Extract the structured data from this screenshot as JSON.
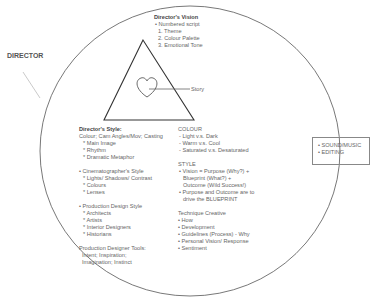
{
  "title": "DIRECTOR",
  "vision": {
    "heading": "Director's Vision",
    "items": [
      "• Numbered script",
      "1. Theme",
      "2. Colour Palette",
      "3. Emotional Tone"
    ]
  },
  "story_label": "Story",
  "style": {
    "heading": "Director's Style:",
    "lines": [
      "Colour; Cam Angles/Mov; Casting",
      "* Main Image",
      "* Rhythm",
      "* Dramatic Metaphor"
    ]
  },
  "cinematographer": {
    "lines": [
      "• Cinematographer's Style",
      "* Lights/ Shadows/ Contrast",
      "* Colours",
      "* Lenses"
    ]
  },
  "production_design": {
    "lines": [
      "• Production Design Style",
      "* Architects",
      "* Artists",
      "* Interior Designers",
      "* Historians"
    ]
  },
  "designer_tools": {
    "lines": [
      "Production Designer Tools:",
      "Intent; Inspiration;",
      "Imagination; Instinct"
    ]
  },
  "colour": {
    "heading": "COLOUR",
    "lines": [
      "- Light v.s. Dark",
      "- Warm v.s. Cool",
      "- Saturated v.s. Desaturated"
    ]
  },
  "style2": {
    "heading": "STYLE",
    "lines": [
      "• Vision = Purpose (Why?) +",
      "Blueprint (What?) +",
      "Outcome (Wild Success!)",
      "• Purpose and Outcome are to",
      "drive the BLUEPRINT"
    ]
  },
  "technique": {
    "heading": "Technique Creative",
    "lines": [
      "• How",
      "• Development",
      "• Guidelines (Process) - Why",
      "• Personal Vision/ Response",
      "• Sentiment"
    ]
  },
  "side_box": {
    "lines": [
      "• SOUND/MUSIC",
      "• EDITING"
    ]
  },
  "colors": {
    "stroke": "#555555",
    "leader": "#bbbbbb",
    "text": "#666666"
  }
}
